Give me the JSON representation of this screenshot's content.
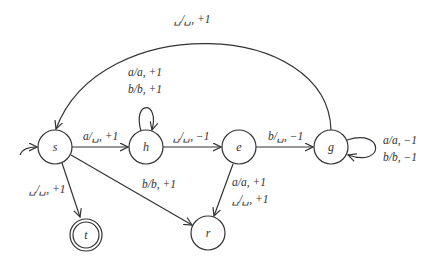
{
  "diagram": {
    "type": "turing-machine-state-diagram",
    "start_state": "s",
    "accept_states": [
      "t"
    ],
    "states": [
      {
        "id": "s",
        "label": "s",
        "x": 55,
        "y": 147
      },
      {
        "id": "h",
        "label": "h",
        "x": 146,
        "y": 147
      },
      {
        "id": "e",
        "label": "e",
        "x": 239,
        "y": 147
      },
      {
        "id": "g",
        "label": "g",
        "x": 331,
        "y": 147
      },
      {
        "id": "t",
        "label": "t",
        "x": 86,
        "y": 235
      },
      {
        "id": "r",
        "label": "r",
        "x": 208,
        "y": 233
      }
    ],
    "transitions": [
      {
        "from": "s",
        "to": "h",
        "labels": [
          "a/␣, +1"
        ]
      },
      {
        "from": "h",
        "to": "h",
        "labels": [
          "a/a, +1",
          "b/b, +1"
        ]
      },
      {
        "from": "h",
        "to": "e",
        "labels": [
          "␣/␣, −1"
        ]
      },
      {
        "from": "e",
        "to": "g",
        "labels": [
          "b/␣, −1"
        ]
      },
      {
        "from": "g",
        "to": "g",
        "labels": [
          "a/a, −1",
          "b/b, −1"
        ]
      },
      {
        "from": "g",
        "to": "s",
        "labels": [
          "␣/␣, +1"
        ]
      },
      {
        "from": "s",
        "to": "t",
        "labels": [
          "␣/␣, +1"
        ]
      },
      {
        "from": "s",
        "to": "r",
        "labels": [
          "b/b, +1"
        ]
      },
      {
        "from": "e",
        "to": "r",
        "labels": [
          "a/a, +1",
          "␣/␣, +1"
        ]
      }
    ]
  },
  "labels": {
    "g_to_s": "␣/␣, +1",
    "h_loop_1": "a/a, +1",
    "h_loop_2": "b/b, +1",
    "s_to_h": "a/␣, +1",
    "h_to_e": "␣/␣, −1",
    "e_to_g": "b/␣, −1",
    "g_loop_1": "a/a, −1",
    "g_loop_2": "b/b, −1",
    "s_to_t": "␣/␣, +1",
    "s_to_r": "b/b, +1",
    "e_to_r_1": "a/a, +1",
    "e_to_r_2": "␣/␣, +1"
  },
  "nodes": {
    "s": "s",
    "h": "h",
    "e": "e",
    "g": "g",
    "t": "t",
    "r": "r"
  }
}
